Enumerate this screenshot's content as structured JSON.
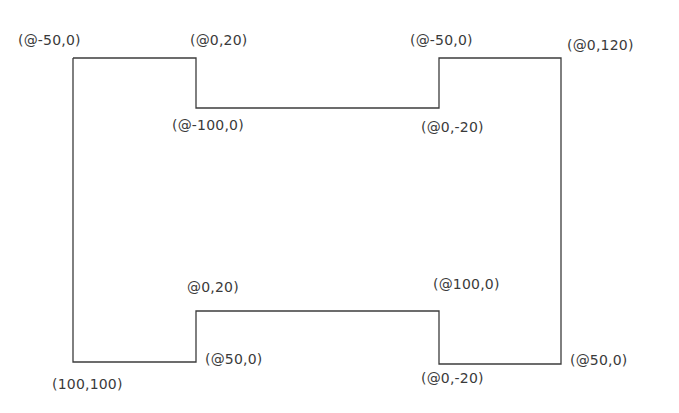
{
  "diagram": {
    "type": "polyline-outline",
    "stroke_color": "#3c3c3c",
    "labels": [
      {
        "id": "top-left-corner",
        "text": "(@-50,0)",
        "x": 18,
        "y": 32
      },
      {
        "id": "top-left-notch-corner",
        "text": "(@0,20)",
        "x": 190,
        "y": 32
      },
      {
        "id": "top-left-notch-bottom",
        "text": "(@-100,0)",
        "x": 172,
        "y": 117
      },
      {
        "id": "top-right-notch-top",
        "text": "(@-50,0)",
        "x": 410,
        "y": 32
      },
      {
        "id": "top-right-corner",
        "text": "(@0,120)",
        "x": 567,
        "y": 37
      },
      {
        "id": "top-right-notch-bottom",
        "text": "(@0,-20)",
        "x": 421,
        "y": 119
      },
      {
        "id": "bottom-left-notch-top",
        "text": "@0,20)",
        "x": 187,
        "y": 279
      },
      {
        "id": "bottom-left-notch-corner",
        "text": "(@50,0)",
        "x": 205,
        "y": 351
      },
      {
        "id": "bottom-left-corner",
        "text": "(100,100)",
        "x": 52,
        "y": 376
      },
      {
        "id": "bottom-right-notch-top",
        "text": "(@100,0)",
        "x": 433,
        "y": 276
      },
      {
        "id": "bottom-right-notch-corner",
        "text": "(@0,-20)",
        "x": 421,
        "y": 370
      },
      {
        "id": "bottom-right-corner",
        "text": "(@50,0)",
        "x": 570,
        "y": 352
      }
    ]
  }
}
